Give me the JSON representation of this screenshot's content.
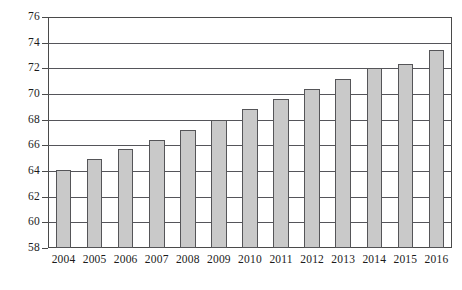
{
  "chart_data": {
    "type": "bar",
    "title": "",
    "subtitle": "",
    "xlabel": "",
    "ylabel": "",
    "categories": [
      "2004",
      "2005",
      "2006",
      "2007",
      "2008",
      "2009",
      "2010",
      "2011",
      "2012",
      "2013",
      "2014",
      "2015",
      "2016"
    ],
    "values": [
      64.1,
      64.9,
      65.7,
      66.4,
      67.2,
      68.0,
      68.8,
      69.6,
      70.4,
      71.2,
      72.0,
      72.3,
      73.4
    ],
    "ylim": [
      58,
      76
    ],
    "ytick_labels": [
      "76",
      "74",
      "72",
      "70",
      "68",
      "66",
      "64",
      "62",
      "60",
      "58"
    ],
    "ytick_values": [
      76,
      74,
      72,
      70,
      68,
      66,
      64,
      62,
      60,
      58
    ],
    "grid": true,
    "legend": false,
    "legend_position": "none",
    "annotations": [],
    "colors": {
      "bar_fill": "#c9c9c9",
      "bar_border": "#555558",
      "axis": "#4a4a4a",
      "gridline": "#55555a",
      "text": "#1b1b1b",
      "background": "#ffffff"
    }
  }
}
